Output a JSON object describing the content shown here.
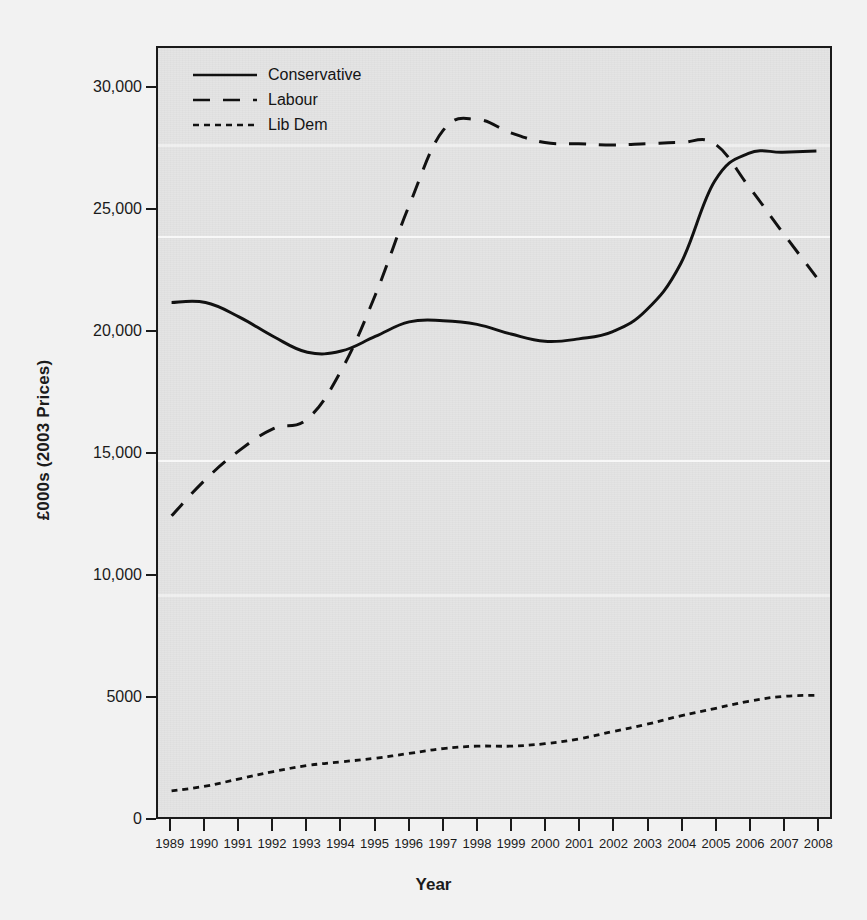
{
  "chart_data": {
    "type": "line",
    "title": "",
    "xlabel": "Year",
    "ylabel": "£000s (2003 Prices)",
    "x": [
      1989,
      1990,
      1991,
      1992,
      1993,
      1994,
      1995,
      1996,
      1997,
      1998,
      1999,
      2000,
      2001,
      2002,
      2003,
      2004,
      2005,
      2006,
      2007,
      2008
    ],
    "xtick_labels": [
      "1989",
      "1990",
      "1991",
      "1992",
      "1993",
      "1994",
      "1995",
      "1996",
      "1997",
      "1998",
      "1999",
      "2000",
      "2001",
      "2002",
      "2003",
      "2004",
      "2005",
      "2006",
      "2007",
      "2008"
    ],
    "ytick_labels": [
      "0",
      "5000",
      "10,000",
      "15,000",
      "20,000",
      "25,000",
      "30,000"
    ],
    "ytick_values": [
      0,
      5000,
      10000,
      15000,
      20000,
      25000,
      30000
    ],
    "ylim": [
      0,
      31700
    ],
    "xlim": [
      1988.6,
      2008.4
    ],
    "grid": false,
    "legend_position": "top-left",
    "series": [
      {
        "name": "Conservative",
        "style": "solid",
        "color": "#111111",
        "values": [
          21200,
          21200,
          20600,
          19800,
          19150,
          19200,
          19800,
          20400,
          20450,
          20300,
          19900,
          19600,
          19700,
          20000,
          20900,
          22800,
          26200,
          27350,
          27400,
          27450
        ]
      },
      {
        "name": "Labour",
        "style": "dashed",
        "color": "#111111",
        "values": [
          12400,
          13900,
          15100,
          16000,
          16400,
          18400,
          21500,
          25200,
          28300,
          28750,
          28200,
          27800,
          27750,
          27700,
          27750,
          27800,
          27750,
          26000,
          24100,
          22250
        ]
      },
      {
        "name": "Lib Dem",
        "style": "dotted",
        "color": "#111111",
        "values": [
          1050,
          1250,
          1550,
          1850,
          2100,
          2250,
          2400,
          2600,
          2800,
          2900,
          2900,
          3000,
          3200,
          3500,
          3800,
          4150,
          4450,
          4750,
          4950,
          5000
        ]
      }
    ]
  },
  "legend": {
    "items": [
      {
        "label": "Conservative",
        "style": "solid"
      },
      {
        "label": "Labour",
        "style": "dashed"
      },
      {
        "label": "Lib Dem",
        "style": "dotted"
      }
    ]
  },
  "colors": {
    "panel_background": "#e4e4e4",
    "page_background": "#f2f2f2",
    "ink": "#111111",
    "axis": "#1a1a1a"
  }
}
